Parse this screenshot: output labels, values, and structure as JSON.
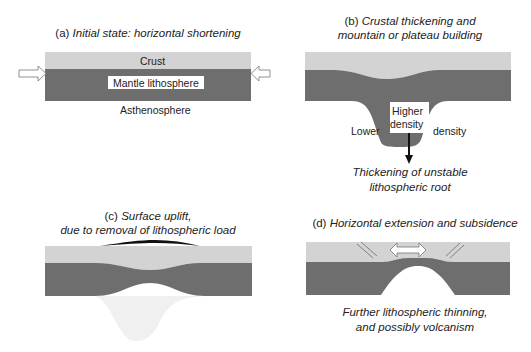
{
  "colors": {
    "crust": "#d3d3d3",
    "mantle": "#6e6e6e",
    "background": "#ffffff",
    "root_ghost": "#eeeeee",
    "uplift": "#111111"
  },
  "panels": {
    "a": {
      "prefix": "(a)",
      "title": "Initial state: horizontal shortening",
      "labels": {
        "crust": "Crust",
        "mantle": "Mantle lithosphere",
        "asthenosphere": "Asthenosphere"
      },
      "icons": [
        "compression-arrow-left",
        "compression-arrow-right"
      ]
    },
    "b": {
      "prefix": "(b)",
      "title_line1": "Crustal thickening and",
      "title_line2": "mountain or plateau building",
      "labels": {
        "higher": "Higher",
        "density_inner": "density",
        "lower": "Lower",
        "density_outer": "density"
      },
      "caption_line1": "Thickening of unstable",
      "caption_line2": "lithospheric root",
      "icons": [
        "down-arrow"
      ]
    },
    "c": {
      "prefix": "(c)",
      "title_line1": "Surface uplift,",
      "title_line2": "due to removal of lithospheric load"
    },
    "d": {
      "prefix": "(d)",
      "title": "Horizontal extension and subsidence",
      "caption_line1": "Further lithospheric thinning,",
      "caption_line2": "and possibly volcanism",
      "icons": [
        "extension-double-arrow",
        "normal-fault-left",
        "normal-fault-right"
      ]
    }
  }
}
